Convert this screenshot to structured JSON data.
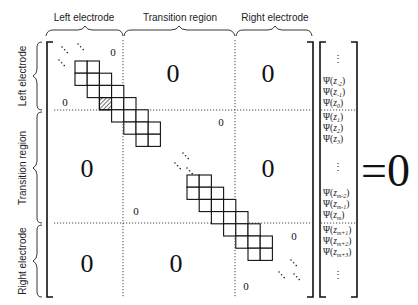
{
  "diagram": {
    "column_labels": [
      "Left electrode",
      "Transition region",
      "Right electrode"
    ],
    "row_labels": [
      "Left electrode",
      "Transition region",
      "Right electrode"
    ],
    "block_values": {
      "left_left_corner": "0",
      "left_left_upper": "0",
      "left_transition": "0",
      "left_right": "0",
      "transition_left": "0",
      "transition_transition_upper": "0",
      "transition_transition_lower": "0",
      "transition_right": "0",
      "right_left": "0",
      "right_transition": "0",
      "right_right_upper": "0",
      "right_right_lower": "0"
    },
    "vector": {
      "top_ellipsis": "⋮",
      "left_entries": [
        {
          "func": "Ψ",
          "var": "z",
          "sub": "-2"
        },
        {
          "func": "Ψ",
          "var": "z",
          "sub": "-1"
        },
        {
          "func": "Ψ",
          "var": "z",
          "sub": "0"
        }
      ],
      "transition_top_entries": [
        {
          "func": "Ψ",
          "var": "z",
          "sub": "1"
        },
        {
          "func": "Ψ",
          "var": "z",
          "sub": "2"
        },
        {
          "func": "Ψ",
          "var": "z",
          "sub": "3"
        }
      ],
      "middle_ellipsis": "⋮",
      "transition_bottom_entries": [
        {
          "func": "Ψ",
          "var": "z",
          "sub": "m-2"
        },
        {
          "func": "Ψ",
          "var": "z",
          "sub": "m-1"
        },
        {
          "func": "Ψ",
          "var": "z",
          "sub": "m"
        }
      ],
      "right_entries": [
        {
          "func": "Ψ",
          "var": "z",
          "sub": "m+1"
        },
        {
          "func": "Ψ",
          "var": "z",
          "sub": "m+2"
        },
        {
          "func": "Ψ",
          "var": "z",
          "sub": "m+3"
        }
      ],
      "bottom_ellipsis": "⋮"
    },
    "equation_rhs": "=0",
    "colors": {
      "ink": "#111111",
      "label": "#222222",
      "background": "#ffffff"
    }
  }
}
